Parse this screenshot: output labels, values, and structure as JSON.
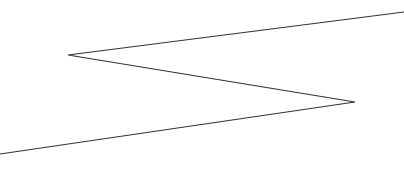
{
  "canvas": {
    "width": 404,
    "height": 184,
    "background": "#ffffff"
  },
  "drawing": {
    "shape": "zigzag-polyline",
    "stroke_color": "#333333",
    "stroke_width": 1.2,
    "points": [
      [
        404,
        12
      ],
      [
        68,
        55
      ],
      [
        355,
        102
      ],
      [
        0,
        154
      ]
    ]
  }
}
